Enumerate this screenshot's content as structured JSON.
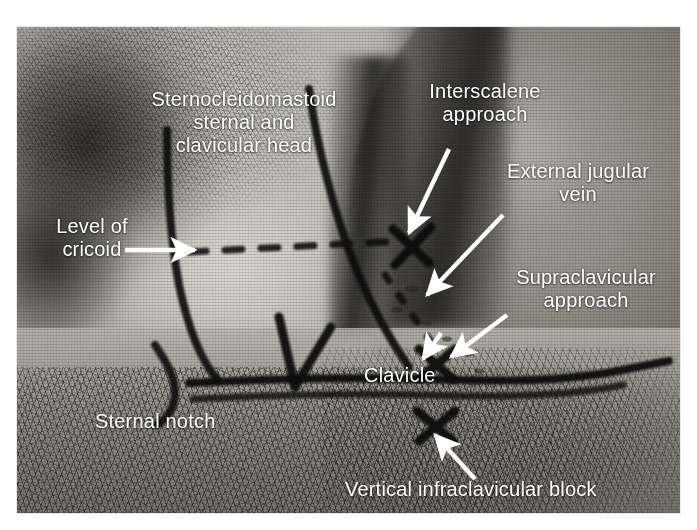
{
  "figure": {
    "kind": "anatomical-photograph",
    "label_color": "#ffffff",
    "marker_color": "#1a1a1a"
  },
  "labels": [
    {
      "id": "sternocleidomastoid",
      "text": "Sternocleidomastoid\nsternal and\nclavicular head",
      "align": "center",
      "x": 126,
      "y": 88,
      "width": 236,
      "pointer": "none"
    },
    {
      "id": "level-of-cricoid",
      "text": "Level of\ncricoid",
      "align": "center",
      "x": 32,
      "y": 215,
      "width": 120,
      "pointer": "arrow-right"
    },
    {
      "id": "interscalene-approach",
      "text": "Interscalene\napproach",
      "align": "center",
      "x": 405,
      "y": 80,
      "width": 160,
      "pointer": "arrow-down-left"
    },
    {
      "id": "external-jugular-vein",
      "text": "External jugular\nvein",
      "align": "center",
      "x": 478,
      "y": 160,
      "width": 200,
      "pointer": "arrow-down-left"
    },
    {
      "id": "supraclavicular-approach",
      "text": "Supraclavicular\napproach",
      "align": "center",
      "x": 496,
      "y": 266,
      "width": 180,
      "pointer": "arrow-down-left"
    },
    {
      "id": "clavicle",
      "text": "Clavicle",
      "align": "left",
      "x": 364,
      "y": 364,
      "width": 100,
      "pointer": "none"
    },
    {
      "id": "sternal-notch",
      "text": "Sternal notch",
      "align": "left",
      "x": 95,
      "y": 410,
      "width": 160,
      "pointer": "none"
    },
    {
      "id": "vertical-infraclavicular-block",
      "text": "Vertical infraclavicular block",
      "align": "left",
      "x": 345,
      "y": 478,
      "width": 320,
      "pointer": "arrow-up-left"
    }
  ],
  "landmarks": [
    {
      "id": "scm-sternal-head-border",
      "type": "marker-line",
      "description": "curved ink line, anterior border of sternocleidomastoid"
    },
    {
      "id": "scm-clavicular-head-border",
      "type": "marker-line",
      "description": "curved ink line, posterior border of sternocleidomastoid"
    },
    {
      "id": "cricoid-level-line",
      "type": "marker-dashed-line",
      "description": "horizontal dashed line at cricoid level"
    },
    {
      "id": "external-jugular-vein-line",
      "type": "marker-dashed-line",
      "description": "oblique dotted line over the external jugular vein"
    },
    {
      "id": "clavicle-line",
      "type": "marker-line",
      "description": "long ink line along the clavicle"
    },
    {
      "id": "sternal-notch-mark",
      "type": "marker-line",
      "description": "V-shaped ink mark at the sternal notch"
    },
    {
      "id": "interscalene-injection-x",
      "type": "marker-x",
      "description": "X marking the interscalene injection site"
    },
    {
      "id": "supraclavicular-injection-x",
      "type": "marker-x",
      "description": "X marking the supraclavicular injection site"
    },
    {
      "id": "infraclavicular-injection-x",
      "type": "marker-x",
      "description": "X marking the vertical infraclavicular injection site"
    }
  ]
}
